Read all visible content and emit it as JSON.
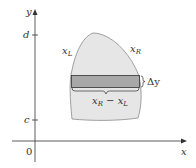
{
  "diagram": {
    "axes": {
      "x_label": "x",
      "y_label": "y",
      "origin_label": "0",
      "y_ticks": [
        {
          "label": "d",
          "y": 35
        },
        {
          "label": "c",
          "y": 120
        }
      ]
    },
    "curves": {
      "left_label": "x",
      "left_sub": "L",
      "right_label": "x",
      "right_sub": "R"
    },
    "strip": {
      "height_label": "Δy",
      "width_label_a": "x",
      "width_label_a_sub": "R",
      "width_label_minus": " − ",
      "width_label_b": "x",
      "width_label_b_sub": "L"
    },
    "colors": {
      "region_fill": "#e6e6e6",
      "region_stroke": "#8a8a8a",
      "strip_fill": "#a8a8a8",
      "strip_stroke": "#333333",
      "axis": "#333333"
    }
  }
}
